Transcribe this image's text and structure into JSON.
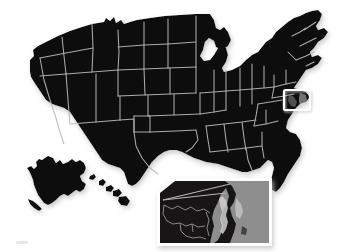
{
  "figure": {
    "title": "Map of the United States with Chesapeake Bay detail inset",
    "alt": "Silhouette map of the United States in near-black with light gray state outlines, Alaska and Hawaii at lower left, a small white highlight box over the Maryland / Chesapeake Bay area, and a larger magnified inset panel showing the Chesapeake Bay in detail",
    "background_color": "#ffffff",
    "land_color": "#0d0b0b",
    "border_color": "#b9b9b9",
    "callout_stroke_color": "#ffffff",
    "inset_frame_color": "#ffffff",
    "inset_water_color": "#8e8e8e",
    "inset_land_color": "#171515",
    "shadow_color": "#d9d9d9"
  },
  "callout": {
    "name": "chesapeake-bay-highlight",
    "label": "Chesapeake Bay highlight box",
    "x": 284,
    "y": 90,
    "width": 26,
    "height": 20
  },
  "inset": {
    "name": "chesapeake-bay-detail",
    "label": "Chesapeake Bay magnified detail",
    "x": 157,
    "y": 178,
    "width": 115,
    "height": 68,
    "clipped_corner": "top-left"
  },
  "regions": [
    {
      "name": "contiguous-united-states",
      "label": "Contiguous United States"
    },
    {
      "name": "alaska",
      "label": "Alaska"
    },
    {
      "name": "hawaii",
      "label": "Hawaii"
    }
  ]
}
